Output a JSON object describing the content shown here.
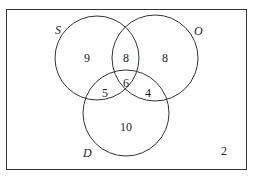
{
  "diagram": {
    "type": "venn",
    "sets": [
      {
        "name": "S",
        "cx": 97,
        "cy": 58,
        "r": 42,
        "label_x": 57,
        "label_y": 34
      },
      {
        "name": "O",
        "cx": 155,
        "cy": 58,
        "r": 43,
        "label_x": 196,
        "label_y": 35
      },
      {
        "name": "D",
        "cx": 126,
        "cy": 113,
        "r": 43,
        "label_x": 87,
        "label_y": 157
      }
    ],
    "regions": {
      "S_only": "9",
      "S_and_O_only": "8",
      "O_only": "8",
      "S_and_D_only": "5",
      "S_O_D": "6",
      "O_and_D_only": "4",
      "D_only": "10",
      "outside": "2"
    },
    "colors": {
      "stroke": "#333333",
      "background": "#ffffff"
    }
  }
}
